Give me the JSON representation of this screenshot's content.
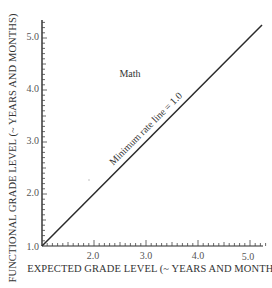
{
  "chart_data": {
    "type": "line",
    "title": "",
    "annotation_subject": "Math",
    "xlabel": "EXPECTED GRADE LEVEL (~ YEARS AND MONTHS)",
    "ylabel": "FUNCTIONAL GRADE LEVEL (~ YEARS AND MONTHS)",
    "xlim": [
      1.0,
      5.3
    ],
    "ylim": [
      1.0,
      5.3
    ],
    "x_ticks": [
      "2.0",
      "3.0",
      "4.0",
      "5.0"
    ],
    "y_ticks": [
      "1.0",
      "2.0",
      "3.0",
      "4.0",
      "5.0"
    ],
    "origin_label": "1.0",
    "minor_tick_step": 0.1,
    "grid": false,
    "legend": null,
    "series": [
      {
        "name": "Minimum rate line = 1.0",
        "x": [
          1.0,
          5.3
        ],
        "y": [
          1.0,
          5.3
        ],
        "slope": 1.0
      }
    ],
    "annotations": [
      {
        "text": "Math",
        "x": 2.7,
        "y": 4.3
      },
      {
        "text": "Minimum rate line = 1.0",
        "x": 3.0,
        "y": 3.2,
        "rotation": -45
      }
    ]
  },
  "labels": {
    "subject": "Math",
    "line_label": "Minimum rate line = 1.0",
    "xlabel": "EXPECTED GRADE LEVEL (~ YEARS AND MONTHS)",
    "ylabel": "FUNCTIONAL GRADE LEVEL (~ YEARS AND MONTHS)",
    "x_tick_2": "2.0",
    "x_tick_3": "3.0",
    "x_tick_4": "4.0",
    "x_tick_5": "5.0",
    "y_tick_1": "1.0",
    "y_tick_2": "2.0",
    "y_tick_3": "3.0",
    "y_tick_4": "4.0",
    "y_tick_5": "5.0"
  }
}
